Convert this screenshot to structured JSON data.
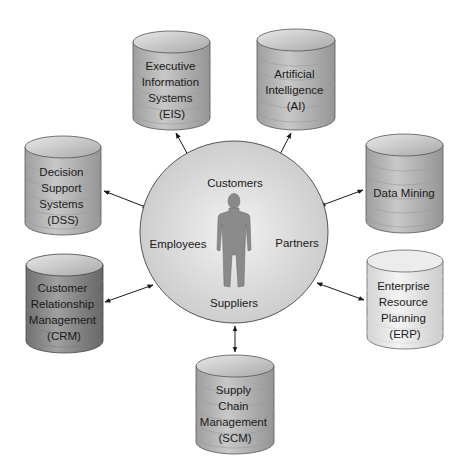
{
  "center": {
    "labels": {
      "top": "Customers",
      "left": "Employees",
      "right": "Partners",
      "bottom": "Suppliers"
    },
    "icon": "person-silhouette-icon"
  },
  "systems": [
    {
      "id": "eis",
      "lines": [
        "Executive",
        "Information",
        "Systems",
        "(EIS)"
      ],
      "shade": "#a9a9a9"
    },
    {
      "id": "ai",
      "lines": [
        "Artificial",
        "Intelligence",
        "(AI)"
      ],
      "shade": "#a9a9a9"
    },
    {
      "id": "dss",
      "lines": [
        "Decision",
        "Support",
        "Systems",
        "(DSS)"
      ],
      "shade": "#b4b4b4"
    },
    {
      "id": "dm",
      "lines": [
        "Data Mining"
      ],
      "shade": "#b0b0b0"
    },
    {
      "id": "crm",
      "lines": [
        "Customer",
        "Relationship",
        "Management",
        "(CRM)"
      ],
      "shade": "#8c8c8c"
    },
    {
      "id": "erp",
      "lines": [
        "Enterprise",
        "Resource",
        "Planning",
        "(ERP)"
      ],
      "shade": "#e4e4e4"
    },
    {
      "id": "scm",
      "lines": [
        "Supply",
        "Chain",
        "Management",
        "(SCM)"
      ],
      "shade": "#b0b0b0"
    }
  ]
}
